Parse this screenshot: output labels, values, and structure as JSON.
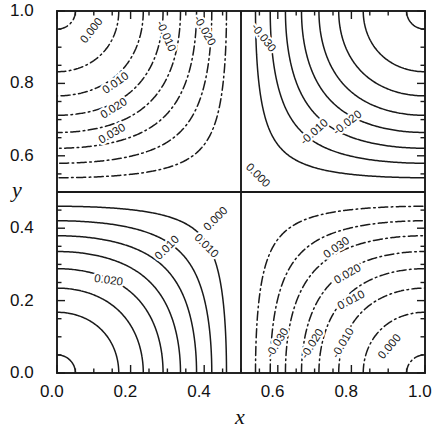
{
  "figure": {
    "kind": "contour-plot",
    "background": "#ffffff",
    "ink": "#1a1a1a"
  },
  "axes": {
    "x_name": "x",
    "y_name": "y",
    "x_ticks": [
      "0.0",
      "0.2",
      "0.4",
      "0.6",
      "0.8",
      "1.0"
    ],
    "y_ticks": [
      "0.0",
      "0.2",
      "0.4",
      "0.6",
      "0.8",
      "1.0"
    ],
    "frame": {
      "left": 57,
      "top": 11,
      "right": 425,
      "bottom": 373
    }
  },
  "chart_data": {
    "type": "contour",
    "title": "",
    "xlabel": "x",
    "ylabel": "y",
    "xlim": [
      0.0,
      1.0
    ],
    "ylim": [
      0.0,
      1.0
    ],
    "xticks": [
      0.0,
      0.2,
      0.4,
      0.6,
      0.8,
      1.0
    ],
    "yticks": [
      0.0,
      0.2,
      0.4,
      0.6,
      0.8,
      1.0
    ],
    "minor_tick_step": 0.05,
    "grid": false,
    "legend": null,
    "field_expression": "0.0405 * cos(pi*x) * cos(pi*y)",
    "level_step": 0.005,
    "levels": [
      -0.04,
      -0.035,
      -0.03,
      -0.025,
      -0.02,
      -0.015,
      -0.01,
      -0.005,
      0.0,
      0.005,
      0.01,
      0.015,
      0.02,
      0.025,
      0.03,
      0.035,
      0.04
    ],
    "positive_style": "solid",
    "negative_style": "dash-dot",
    "zero_style": "solid",
    "extrema": [
      {
        "label": "maximum",
        "x": 0.0,
        "y": 0.5,
        "value": 0.0405
      },
      {
        "label": "maximum",
        "x": 1.0,
        "y": 0.5,
        "value": 0.0405
      },
      {
        "label": "minimum",
        "x": 0.5,
        "y": 1.0,
        "value": -0.0405
      },
      {
        "label": "minimum",
        "x": 0.5,
        "y": 0.0,
        "value": -0.0405
      }
    ],
    "saddle_point": {
      "x": 0.5,
      "y": 0.5,
      "value": 0.0
    },
    "labeled_levels": [
      "0.000",
      "0.010",
      "0.020",
      "0.030",
      "-0.010",
      "-0.020",
      "-0.030"
    ],
    "inline_labels": [
      {
        "text": "0.000",
        "x": 0.095,
        "y": 0.945,
        "rot": -52
      },
      {
        "text": "0.010",
        "x": 0.16,
        "y": 0.8,
        "rot": -35
      },
      {
        "text": "0.020",
        "x": 0.155,
        "y": 0.73,
        "rot": -32
      },
      {
        "text": "0.030",
        "x": 0.15,
        "y": 0.66,
        "rot": -30
      },
      {
        "text": "-0.010",
        "x": 0.295,
        "y": 0.93,
        "rot": 66
      },
      {
        "text": "-0.020",
        "x": 0.4,
        "y": 0.945,
        "rot": 60
      },
      {
        "text": "-0.030",
        "x": 0.56,
        "y": 0.925,
        "rot": 52
      },
      {
        "text": "-0.010",
        "x": 0.7,
        "y": 0.665,
        "rot": -42
      },
      {
        "text": "-0.020",
        "x": 0.79,
        "y": 0.69,
        "rot": -38
      },
      {
        "text": "0.000",
        "x": 0.545,
        "y": 0.545,
        "rot": 45
      },
      {
        "text": "0.000",
        "x": 0.432,
        "y": 0.425,
        "rot": -45
      },
      {
        "text": "0.010",
        "x": 0.3,
        "y": 0.345,
        "rot": -45
      },
      {
        "text": "0.010",
        "x": 0.405,
        "y": 0.35,
        "rot": 45
      },
      {
        "text": "0.020",
        "x": 0.14,
        "y": 0.255,
        "rot": 8
      },
      {
        "text": "0.030",
        "x": 0.76,
        "y": 0.345,
        "rot": -35
      },
      {
        "text": "0.020",
        "x": 0.79,
        "y": 0.272,
        "rot": -30
      },
      {
        "text": "0.010",
        "x": 0.8,
        "y": 0.2,
        "rot": -28
      },
      {
        "text": "-0.030",
        "x": 0.6,
        "y": 0.082,
        "rot": -58
      },
      {
        "text": "-0.020",
        "x": 0.695,
        "y": 0.08,
        "rot": -58
      },
      {
        "text": "-0.010",
        "x": 0.778,
        "y": 0.082,
        "rot": -60
      },
      {
        "text": "0.000",
        "x": 0.905,
        "y": 0.072,
        "rot": -50
      }
    ]
  }
}
